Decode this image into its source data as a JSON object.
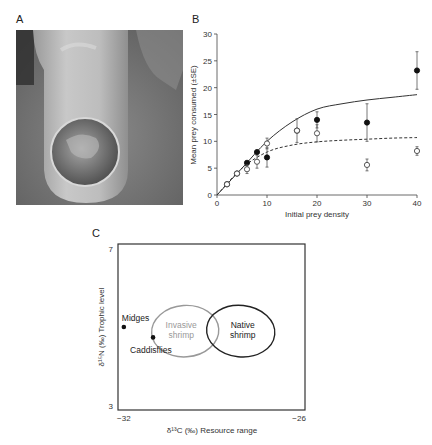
{
  "panels": {
    "a": {
      "label": "A",
      "image_description": "Close-up photo of an invasive shrimp's cephalic/anterior region held near a fingertip with prey visible in a circular cavity"
    },
    "b": {
      "label": "B"
    },
    "c": {
      "label": "C"
    }
  },
  "chart_data": [
    {
      "panel": "B",
      "type": "scatter",
      "title": "",
      "xlabel": "Initial prey density",
      "ylabel": "Mean prey consumed (±SE)",
      "xlim": [
        0,
        40
      ],
      "ylim": [
        0,
        30
      ],
      "xticks": [
        0,
        10,
        20,
        30,
        40
      ],
      "yticks": [
        0,
        5,
        10,
        15,
        20,
        25,
        30
      ],
      "grid": false,
      "legend": null,
      "series": [
        {
          "name": "filled circles",
          "marker": "filled-circle",
          "x": [
            2,
            4,
            6,
            8,
            10,
            16,
            20,
            30,
            40
          ],
          "y": [
            2,
            4,
            6,
            8,
            7,
            12,
            14,
            13.5,
            23.2
          ],
          "se": [
            0,
            0,
            0,
            0,
            1.8,
            0,
            1.5,
            3.5,
            3.5
          ]
        },
        {
          "name": "open circles",
          "marker": "open-circle",
          "x": [
            2,
            4,
            6,
            8,
            10,
            16,
            20,
            30,
            40
          ],
          "y": [
            2,
            4,
            4.8,
            6.2,
            9.6,
            12,
            11.5,
            5.6,
            8.2
          ],
          "se": [
            0,
            0,
            0.8,
            1.2,
            1.0,
            2.2,
            1.6,
            1.1,
            0.8
          ]
        }
      ],
      "fits": [
        {
          "name": "solid fit (filled)",
          "style": "solid",
          "x": [
            0,
            5,
            10,
            15,
            20,
            25,
            30,
            35,
            40
          ],
          "y": [
            0,
            5,
            10,
            13.6,
            16,
            17,
            17.7,
            18.2,
            18.7
          ]
        },
        {
          "name": "dashed fit (open)",
          "style": "dashed",
          "x": [
            0,
            5,
            10,
            15,
            20,
            25,
            30,
            35,
            40
          ],
          "y": [
            0,
            5,
            8,
            9.3,
            9.9,
            10.2,
            10.4,
            10.6,
            10.7
          ]
        }
      ],
      "tick_labels": {
        "x": [
          "0",
          "10",
          "20",
          "30",
          "40"
        ],
        "y": [
          "0",
          "5",
          "10",
          "15",
          "20",
          "25",
          "30"
        ]
      }
    },
    {
      "panel": "C",
      "type": "scatter",
      "title": "",
      "xlabel": "δ¹³C (‰) Resource range",
      "ylabel": "δ¹⁵N (‰) Trophic level",
      "xlim": [
        -32.2,
        -25.8
      ],
      "ylim": [
        3,
        7
      ],
      "xticks": [
        -32,
        -26
      ],
      "yticks": [
        3,
        7
      ],
      "tick_labels": {
        "x": [
          "−32",
          "−26"
        ],
        "y": [
          "3",
          "7"
        ]
      },
      "grid": false,
      "points": [
        {
          "label": "Midges",
          "x": -32,
          "y": 5.0
        },
        {
          "label": "Caddisflies",
          "x": -31.0,
          "y": 4.75
        }
      ],
      "ellipses": [
        {
          "label": "Invasive\nshrimp",
          "label_lines": [
            "Invasive",
            "shrimp"
          ],
          "color": "#999999",
          "cx": -29.9,
          "cy": 4.9,
          "rx": 1.15,
          "ry": 0.62
        },
        {
          "label": "Native\nshrimp",
          "label_lines": [
            "Native",
            "shrimp"
          ],
          "color": "#222222",
          "cx": -28.0,
          "cy": 4.9,
          "rx": 1.17,
          "ry": 0.62
        }
      ]
    }
  ]
}
